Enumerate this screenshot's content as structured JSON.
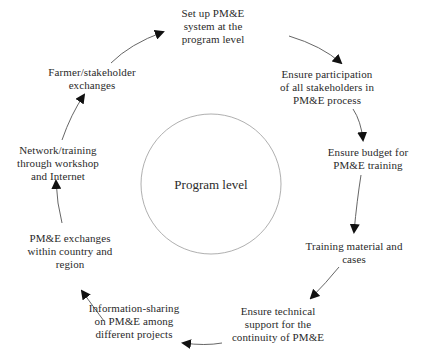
{
  "diagram": {
    "type": "cycle",
    "center": {
      "label": "Program level"
    },
    "nodes": [
      {
        "id": "setup",
        "lines": [
          "Set up PM&E",
          "system at the",
          "program level"
        ]
      },
      {
        "id": "participation",
        "lines": [
          "Ensure participation",
          "of all stakeholders in",
          "PM&E process"
        ]
      },
      {
        "id": "budget",
        "lines": [
          "Ensure budget for",
          "PM&E training"
        ]
      },
      {
        "id": "training-material",
        "lines": [
          "Training material and",
          "cases"
        ]
      },
      {
        "id": "technical-support",
        "lines": [
          "Ensure technical",
          "support for the",
          "continuity of PM&E"
        ]
      },
      {
        "id": "info-sharing",
        "lines": [
          "Information-sharing",
          "on PM&E among",
          "different projects"
        ]
      },
      {
        "id": "pme-exchanges",
        "lines": [
          "PM&E exchanges",
          "within country and",
          "region"
        ]
      },
      {
        "id": "network-training",
        "lines": [
          "Network/training",
          "through workshop",
          "and Internet"
        ]
      },
      {
        "id": "farmer-exchanges",
        "lines": [
          "Farmer/stakeholder",
          "exchanges"
        ]
      }
    ],
    "edges": [
      {
        "from": "setup",
        "to": "participation"
      },
      {
        "from": "participation",
        "to": "budget"
      },
      {
        "from": "budget",
        "to": "training-material"
      },
      {
        "from": "training-material",
        "to": "technical-support"
      },
      {
        "from": "technical-support",
        "to": "info-sharing"
      },
      {
        "from": "info-sharing",
        "to": "pme-exchanges"
      },
      {
        "from": "pme-exchanges",
        "to": "network-training"
      },
      {
        "from": "network-training",
        "to": "farmer-exchanges"
      },
      {
        "from": "farmer-exchanges",
        "to": "setup"
      }
    ],
    "colors": {
      "text": "#2a2a2a",
      "line": "#555555",
      "arrowhead": "#111111",
      "circle": "#9a9a9a"
    }
  }
}
